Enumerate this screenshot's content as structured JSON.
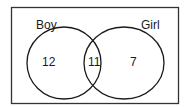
{
  "diagram": {
    "type": "venn",
    "sets": [
      {
        "label": "Boy",
        "only": "12"
      },
      {
        "label": "Girl",
        "only": "7"
      }
    ],
    "intersection": "11",
    "colors": {
      "stroke": "#1a1a1a",
      "background": "#ffffff"
    }
  }
}
